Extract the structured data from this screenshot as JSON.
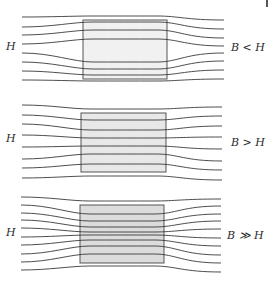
{
  "figure": {
    "colors": {
      "line": "#3a3a3a",
      "box_stroke": "#555555",
      "fill_weak": "#f1f1f1",
      "fill_mid": "#e6e6e6",
      "fill_strong": "#d9d9d9"
    },
    "panels": [
      {
        "name": "panel-b-less-than-h",
        "left_label": "H",
        "right_label": "B < H",
        "left_label_pos": [
          6,
          41
        ],
        "right_label_pos": [
          231,
          42
        ],
        "box": {
          "x": 83,
          "y": 20,
          "w": 84,
          "h": 59,
          "fill": "#f1f1f1"
        },
        "x_start": 22,
        "x_end": 224,
        "lines": [
          {
            "y0": 17,
            "ymid": 16,
            "y1": 20
          },
          {
            "y0": 27,
            "ymid": 22,
            "y1": 29
          },
          {
            "y0": 35,
            "ymid": 30,
            "y1": 38
          },
          {
            "y0": 44,
            "ymid": 39,
            "y1": 46
          },
          {
            "y0": 53,
            "ymid": 62,
            "y1": 53
          },
          {
            "y0": 62,
            "ymid": 69,
            "y1": 61
          },
          {
            "y0": 71,
            "ymid": 75,
            "y1": 70
          },
          {
            "y0": 80,
            "ymid": 81,
            "y1": 79
          }
        ]
      },
      {
        "name": "panel-b-greater-than-h",
        "left_label": "H",
        "right_label": "B > H",
        "left_label_pos": [
          6,
          133
        ],
        "right_label_pos": [
          231,
          137
        ],
        "box": {
          "x": 81,
          "y": 113,
          "w": 85,
          "h": 59,
          "fill": "#e8e8e8"
        },
        "x_start": 22,
        "x_end": 222,
        "lines": [
          {
            "y0": 105,
            "ymid": 109,
            "y1": 107
          },
          {
            "y0": 115,
            "ymid": 120,
            "y1": 116
          },
          {
            "y0": 124,
            "ymid": 130,
            "y1": 126
          },
          {
            "y0": 135,
            "ymid": 138,
            "y1": 137
          },
          {
            "y0": 147,
            "ymid": 146,
            "y1": 149
          },
          {
            "y0": 159,
            "ymid": 154,
            "y1": 161
          },
          {
            "y0": 168,
            "ymid": 164,
            "y1": 170
          },
          {
            "y0": 178,
            "ymid": 176,
            "y1": 180
          }
        ]
      },
      {
        "name": "panel-b-much-greater-than-h",
        "left_label": "H",
        "right_label": "B ≫ H",
        "left_label_pos": [
          6,
          227
        ],
        "right_label_pos": [
          227,
          230
        ],
        "box": {
          "x": 80,
          "y": 205,
          "w": 84,
          "h": 58,
          "fill": "#dcdcdc"
        },
        "x_start": 21,
        "x_end": 221,
        "lines": [
          {
            "y0": 197,
            "ymid": 201,
            "y1": 199
          },
          {
            "y0": 205,
            "ymid": 214,
            "y1": 206
          },
          {
            "y0": 213,
            "ymid": 221,
            "y1": 214
          },
          {
            "y0": 220,
            "ymid": 227,
            "y1": 221
          },
          {
            "y0": 228,
            "ymid": 232,
            "y1": 229
          },
          {
            "y0": 237,
            "ymid": 235,
            "y1": 238
          },
          {
            "y0": 245,
            "ymid": 240,
            "y1": 246
          },
          {
            "y0": 254,
            "ymid": 246,
            "y1": 255
          },
          {
            "y0": 262,
            "ymid": 254,
            "y1": 263
          },
          {
            "y0": 270,
            "ymid": 266,
            "y1": 272
          }
        ]
      }
    ]
  }
}
